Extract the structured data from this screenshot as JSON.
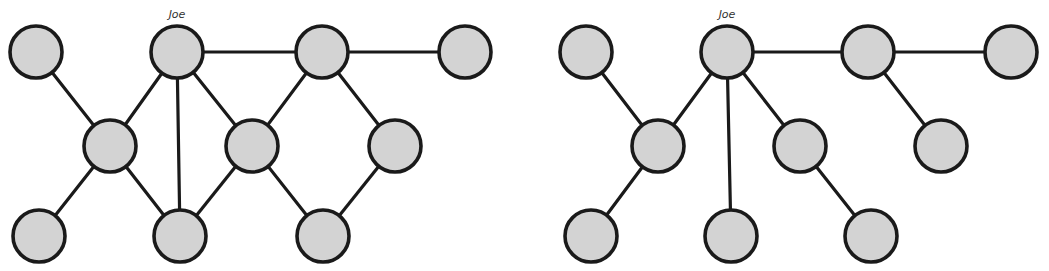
{
  "colors": {
    "node_fill": "#d3d3d3",
    "stroke": "#1a1a1a",
    "label": "#333333",
    "background": "#ffffff"
  },
  "graphs": [
    {
      "name": "social-network-graph",
      "label_node": "n2",
      "label": "Joe",
      "nodes": [
        {
          "id": "n1",
          "x": 36,
          "y": 52
        },
        {
          "id": "n2",
          "x": 177,
          "y": 52
        },
        {
          "id": "n3",
          "x": 322,
          "y": 52
        },
        {
          "id": "n4",
          "x": 465,
          "y": 52
        },
        {
          "id": "n5",
          "x": 110,
          "y": 146
        },
        {
          "id": "n6",
          "x": 252,
          "y": 146
        },
        {
          "id": "n7",
          "x": 395,
          "y": 146
        },
        {
          "id": "n8",
          "x": 39,
          "y": 236
        },
        {
          "id": "n9",
          "x": 180,
          "y": 236
        },
        {
          "id": "n10",
          "x": 323,
          "y": 236
        }
      ],
      "edges": [
        [
          "n1",
          "n5"
        ],
        [
          "n2",
          "n5"
        ],
        [
          "n2",
          "n9"
        ],
        [
          "n2",
          "n6"
        ],
        [
          "n2",
          "n3"
        ],
        [
          "n3",
          "n4"
        ],
        [
          "n3",
          "n6"
        ],
        [
          "n3",
          "n7"
        ],
        [
          "n5",
          "n8"
        ],
        [
          "n5",
          "n9"
        ],
        [
          "n6",
          "n9"
        ],
        [
          "n6",
          "n10"
        ],
        [
          "n7",
          "n10"
        ]
      ]
    },
    {
      "name": "spanning-tree-graph",
      "label_node": "m2",
      "label": "Joe",
      "nodes": [
        {
          "id": "m1",
          "x": 586,
          "y": 52
        },
        {
          "id": "m2",
          "x": 727,
          "y": 52
        },
        {
          "id": "m3",
          "x": 868,
          "y": 52
        },
        {
          "id": "m4",
          "x": 1011,
          "y": 52
        },
        {
          "id": "m5",
          "x": 658,
          "y": 146
        },
        {
          "id": "m6",
          "x": 800,
          "y": 146
        },
        {
          "id": "m7",
          "x": 941,
          "y": 146
        },
        {
          "id": "m8",
          "x": 591,
          "y": 236
        },
        {
          "id": "m9",
          "x": 731,
          "y": 236
        },
        {
          "id": "m10",
          "x": 871,
          "y": 236
        }
      ],
      "edges": [
        [
          "m1",
          "m5"
        ],
        [
          "m2",
          "m5"
        ],
        [
          "m2",
          "m9"
        ],
        [
          "m2",
          "m6"
        ],
        [
          "m2",
          "m3"
        ],
        [
          "m3",
          "m4"
        ],
        [
          "m3",
          "m7"
        ],
        [
          "m5",
          "m8"
        ],
        [
          "m6",
          "m10"
        ]
      ]
    }
  ],
  "node_radius": 26
}
